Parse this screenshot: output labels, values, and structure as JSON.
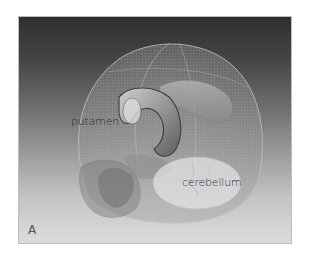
{
  "figure": {
    "panel_label": "A",
    "labels": {
      "putamen": "putamen",
      "cerebellum": "cerebellum"
    },
    "colors": {
      "background_top": "#2e2e2e",
      "background_bottom": "#dcdcdc",
      "skull_mesh": "#b8b8b8",
      "structure_fill": "#9a9a9a",
      "cerebellum_fill": "#e6e6e6"
    }
  }
}
